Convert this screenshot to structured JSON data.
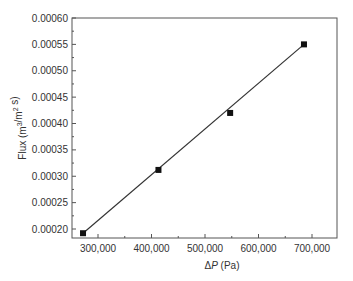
{
  "chart_data": {
    "type": "scatter",
    "title": "",
    "xlabel": "ΔP (Pa)",
    "ylabel": "Flux (m³/m² s)",
    "xlim": [
      260000,
      760000
    ],
    "ylim": [
      0.000175,
      0.0006
    ],
    "x_ticks": [
      300000,
      400000,
      500000,
      600000,
      700000
    ],
    "x_tick_labels": [
      "300,000",
      "400,000",
      "500,000",
      "600,000",
      "700,000"
    ],
    "y_ticks": [
      0.0002,
      0.00025,
      0.0003,
      0.00035,
      0.0004,
      0.00045,
      0.0005,
      0.00055,
      0.0006
    ],
    "y_tick_labels": [
      "0.00020",
      "0.00025",
      "0.00030",
      "0.00035",
      "0.00040",
      "0.00045",
      "0.00050",
      "0.00055",
      "0.00060"
    ],
    "grid": false,
    "legend": null,
    "series": [
      {
        "name": "Measured flux",
        "marker": "square",
        "color": "#111111",
        "x": [
          272000,
          413000,
          547000,
          685000
        ],
        "y": [
          0.000192,
          0.000312,
          0.00042,
          0.00055
        ]
      },
      {
        "name": "Linear fit",
        "style": "line",
        "color": "#333333",
        "x": [
          272000,
          685000
        ],
        "y": [
          0.000192,
          0.00055
        ]
      }
    ]
  }
}
